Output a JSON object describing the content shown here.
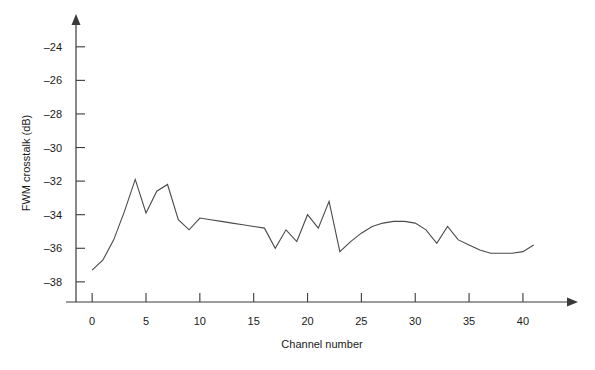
{
  "chart_data": {
    "type": "line",
    "title": "",
    "xlabel": "Channel number",
    "ylabel": "FWM crosstalk (dB)",
    "xlim": [
      -1.5,
      44
    ],
    "ylim": [
      -39.2,
      -23.0
    ],
    "xticks": [
      0,
      5,
      10,
      15,
      20,
      25,
      30,
      35,
      40
    ],
    "xtick_labels": [
      "0",
      "5",
      "10",
      "15",
      "20",
      "25",
      "30",
      "35",
      "40"
    ],
    "yticks": [
      -24,
      -26,
      -28,
      -30,
      -32,
      -34,
      -36,
      -38
    ],
    "ytick_labels": [
      "-24",
      "-26",
      "-28",
      "-30",
      "-32",
      "-34",
      "-36",
      "-38"
    ],
    "grid": false,
    "legend": null,
    "line_color": "#4a4a4a",
    "x": [
      0,
      1,
      2,
      3,
      4,
      5,
      6,
      7,
      8,
      9,
      10,
      11,
      12,
      13,
      14,
      15,
      16,
      17,
      18,
      19,
      20,
      21,
      22,
      23,
      24,
      25,
      26,
      27,
      28,
      29,
      30,
      31,
      32,
      33,
      34,
      35,
      36,
      37,
      38,
      39,
      40,
      41
    ],
    "y": [
      -37.3,
      -36.7,
      -35.5,
      -33.8,
      -31.9,
      -33.9,
      -32.6,
      -32.2,
      -34.3,
      -34.9,
      -34.2,
      -34.3,
      -34.4,
      -34.5,
      -34.6,
      -34.7,
      -34.8,
      -36.0,
      -34.9,
      -35.6,
      -34.0,
      -34.8,
      -33.2,
      -36.2,
      -35.6,
      -35.1,
      -34.7,
      -34.5,
      -34.4,
      -34.4,
      -34.5,
      -34.9,
      -35.7,
      -34.7,
      -35.5,
      -35.8,
      -36.1,
      -36.3,
      -36.3,
      -36.3,
      -36.2,
      -35.8
    ],
    "series": [
      {
        "name": "FWM crosstalk",
        "values": [
          -37.3,
          -36.7,
          -35.5,
          -33.8,
          -31.9,
          -33.9,
          -32.6,
          -32.2,
          -34.3,
          -34.9,
          -34.2,
          -34.3,
          -34.4,
          -34.5,
          -34.6,
          -34.7,
          -34.8,
          -36.0,
          -34.9,
          -35.6,
          -34.0,
          -34.8,
          -33.2,
          -36.2,
          -35.6,
          -35.1,
          -34.7,
          -34.5,
          -34.4,
          -34.4,
          -34.5,
          -34.9,
          -35.7,
          -34.7,
          -35.5,
          -35.8,
          -36.1,
          -36.3,
          -36.3,
          -36.3,
          -36.2,
          -35.8
        ]
      }
    ]
  }
}
